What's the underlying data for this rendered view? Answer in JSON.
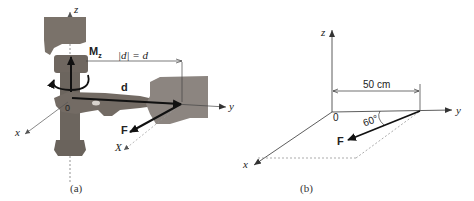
{
  "figure_a": {
    "caption": "(a)",
    "axis_labels": {
      "z": "z",
      "y": "y",
      "x": "x",
      "X_line": "X"
    },
    "moment_label": "M",
    "moment_subscript": "z",
    "distance_label": "|d| = d",
    "vector_d": "d",
    "force": "F",
    "origin": "0"
  },
  "figure_b": {
    "caption": "(b)",
    "axis_labels": {
      "z": "z",
      "y": "y",
      "x": "x"
    },
    "origin": "0",
    "dimension": "50 cm",
    "angle": "60°",
    "force": "F"
  },
  "colors": {
    "line": "#333333",
    "arrow": "#111111",
    "dashed": "#888888",
    "pipe": "#7a726a",
    "hand": "#8c8580"
  }
}
